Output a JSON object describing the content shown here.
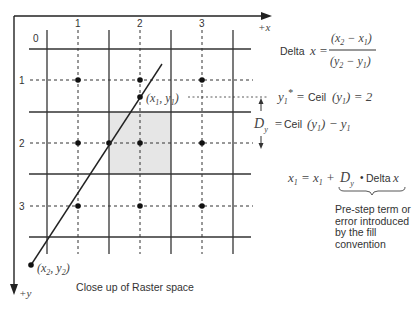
{
  "diagram": {
    "caption": "Close up of Raster space",
    "axes": {
      "x_label": "+x",
      "y_label": "+y"
    },
    "grid": {
      "origin_label": "0",
      "column_labels": [
        "1",
        "2",
        "3"
      ],
      "row_labels": [
        "1",
        "2",
        "3"
      ]
    },
    "points": {
      "p1_label": "(x1, y1)",
      "p2_label": "(x2, y2)"
    },
    "equations": {
      "delta_x": {
        "lhs_word": "Delta",
        "lhs_var": "x",
        "numerator": "(x2 − x1)",
        "denominator": "(y2 − y1)"
      },
      "y1_star": {
        "lhs": "y1* =",
        "fn": "Ceil",
        "arg": "(y1)",
        "rhs": "= 2"
      },
      "d_y": {
        "lhs": "Dy =",
        "fn": "Ceil",
        "arg": "(y1)",
        "rhs": "− y1"
      },
      "x1_update": {
        "lhs": "x1 = x1 + Dy",
        "op": "•",
        "term_word": "Delta",
        "term_var": "x"
      }
    },
    "annotation": "Pre-step term or error introduced by the fill convention",
    "colors": {
      "line": "#222222",
      "shade": "#e6e6e6",
      "text": "#333333"
    }
  }
}
